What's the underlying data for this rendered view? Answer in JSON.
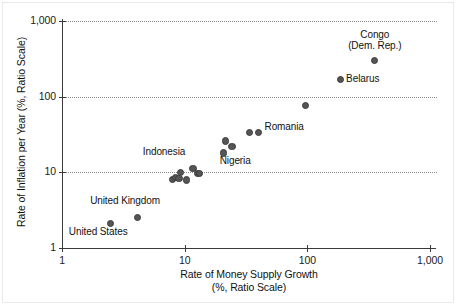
{
  "chart_data": {
    "type": "scatter",
    "title": "",
    "xlabel": "Rate of Money Supply Growth",
    "xlabel_line2": "(%, Ratio Scale)",
    "ylabel": "Rate of Inflation per Year (%, Ratio Scale)",
    "xscale": "log",
    "yscale": "log",
    "xlim": [
      1,
      1000
    ],
    "ylim": [
      1,
      1000
    ],
    "grid": "horizontal-dotted",
    "legend": "none",
    "xticks": [
      {
        "value": 1,
        "label": "1"
      },
      {
        "value": 10,
        "label": "10"
      },
      {
        "value": 100,
        "label": "100"
      },
      {
        "value": 1000,
        "label": "1,000"
      }
    ],
    "yticks": [
      {
        "value": 1,
        "label": "1"
      },
      {
        "value": 10,
        "label": "10"
      },
      {
        "value": 100,
        "label": "100"
      },
      {
        "value": 1000,
        "label": "1,000"
      }
    ],
    "marker_color": "#555555",
    "points": [
      {
        "name": "United States",
        "x": 2.5,
        "y": 2.1,
        "label": "United States",
        "label_dx": -42,
        "label_dy": 8,
        "label_align": "left"
      },
      {
        "name": "United Kingdom",
        "x": 4.1,
        "y": 2.5,
        "label": "United Kingdom",
        "label_dx": -47,
        "label_dy": -17,
        "label_align": "left"
      },
      {
        "name": "unlabeled-1",
        "x": 7.9,
        "y": 8.0,
        "label": "",
        "label_dx": 0,
        "label_dy": 0,
        "label_align": "left"
      },
      {
        "name": "unlabeled-2",
        "x": 8.4,
        "y": 8.5,
        "label": "",
        "label_dx": 0,
        "label_dy": 0,
        "label_align": "left"
      },
      {
        "name": "unlabeled-3",
        "x": 9.0,
        "y": 8.3,
        "label": "",
        "label_dx": 0,
        "label_dy": 0,
        "label_align": "left"
      },
      {
        "name": "Indonesia",
        "x": 9.3,
        "y": 10.0,
        "label": "Indonesia",
        "label_dx": -38,
        "label_dy": -20,
        "label_align": "left"
      },
      {
        "name": "unlabeled-4",
        "x": 10.3,
        "y": 7.9,
        "label": "",
        "label_dx": 0,
        "label_dy": 0,
        "label_align": "left"
      },
      {
        "name": "unlabeled-5",
        "x": 11.7,
        "y": 11.2,
        "label": "",
        "label_dx": 0,
        "label_dy": 0,
        "label_align": "left"
      },
      {
        "name": "unlabeled-6",
        "x": 12.8,
        "y": 9.6,
        "label": "",
        "label_dx": 0,
        "label_dy": 0,
        "label_align": "left"
      },
      {
        "name": "unlabeled-7",
        "x": 13.3,
        "y": 9.6,
        "label": "",
        "label_dx": 0,
        "label_dy": 0,
        "label_align": "left"
      },
      {
        "name": "Nigeria",
        "x": 20.8,
        "y": 18.0,
        "label": "Nigeria",
        "label_dx": -4,
        "label_dy": 8,
        "label_align": "left"
      },
      {
        "name": "unlabeled-8",
        "x": 21.4,
        "y": 26.0,
        "label": "",
        "label_dx": 0,
        "label_dy": 0,
        "label_align": "left"
      },
      {
        "name": "unlabeled-9",
        "x": 24.3,
        "y": 22.0,
        "label": "",
        "label_dx": 0,
        "label_dy": 0,
        "label_align": "left"
      },
      {
        "name": "unlabeled-10",
        "x": 34.0,
        "y": 34.0,
        "label": "",
        "label_dx": 0,
        "label_dy": 0,
        "label_align": "left"
      },
      {
        "name": "Romania",
        "x": 40.0,
        "y": 34.0,
        "label": "Romania",
        "label_dx": 6,
        "label_dy": -5,
        "label_align": "left"
      },
      {
        "name": "unlabeled-11",
        "x": 97.0,
        "y": 77.0,
        "label": "",
        "label_dx": 0,
        "label_dy": 0,
        "label_align": "left"
      },
      {
        "name": "Belarus",
        "x": 185.0,
        "y": 170.0,
        "label": "Belarus",
        "label_dx": 6,
        "label_dy": 0,
        "label_align": "left"
      },
      {
        "name": "Congo (Dem. Rep.)",
        "x": 355.0,
        "y": 300.0,
        "label": "Congo\n(Dem. Rep.)",
        "label_dx": 0,
        "label_dy": -32,
        "label_align": "center"
      }
    ]
  }
}
